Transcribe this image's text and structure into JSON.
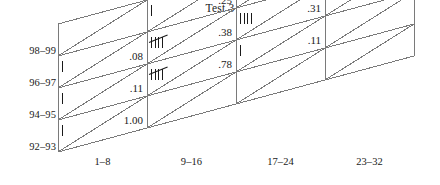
{
  "title": "Test 3",
  "axes": {
    "row_labels": [
      "98–99",
      "96–97",
      "94–95",
      "92–93"
    ],
    "col_labels": [
      "1–8",
      "9–16",
      "17–24",
      "23–32"
    ]
  },
  "colors": {
    "ink": "#1a1a1a",
    "grid": "#7a7a7a",
    "background": "#ffffff"
  },
  "chart_data": {
    "type": "heatmap",
    "title": "Test 3",
    "xlabel": "",
    "ylabel": "",
    "grid": true,
    "legend": "none",
    "x_categories": [
      "1–8",
      "9–16",
      "17–24",
      "23–32"
    ],
    "y_categories": [
      "98–99",
      "96–97",
      "94–95",
      "92–93"
    ],
    "cells": [
      {
        "row": "98–99",
        "col": "1–8",
        "tally": 0,
        "value": ""
      },
      {
        "row": "98–99",
        "col": "9–16",
        "tally": 1,
        "value": ".25"
      },
      {
        "row": "98–99",
        "col": "17–24",
        "tally": 1,
        "value": ".25"
      },
      {
        "row": "98–99",
        "col": "23–32",
        "tally": 2,
        "value": ".50"
      },
      {
        "row": "96–97",
        "col": "1–8",
        "tally": 1,
        "value": ".08"
      },
      {
        "row": "96–97",
        "col": "9–16",
        "tally": 5,
        "value": ".38"
      },
      {
        "row": "96–97",
        "col": "17–24",
        "tally": 4,
        "value": ".31"
      },
      {
        "row": "96–97",
        "col": "23–32",
        "tally": 3,
        "value": ".23"
      },
      {
        "row": "94–95",
        "col": "1–8",
        "tally": 1,
        "value": ".11"
      },
      {
        "row": "94–95",
        "col": "9–16",
        "tally": 5,
        "value": ".78"
      },
      {
        "row": "94–95",
        "col": "17–24",
        "tally": 1,
        "value": ".11"
      },
      {
        "row": "94–95",
        "col": "23–32",
        "tally": 0,
        "value": ""
      },
      {
        "row": "92–93",
        "col": "1–8",
        "tally": 1,
        "value": "1.00"
      },
      {
        "row": "92–93",
        "col": "9–16",
        "tally": 0,
        "value": ""
      },
      {
        "row": "92–93",
        "col": "17–24",
        "tally": 0,
        "value": ""
      },
      {
        "row": "92–93",
        "col": "23–32",
        "tally": 0,
        "value": ""
      }
    ]
  }
}
